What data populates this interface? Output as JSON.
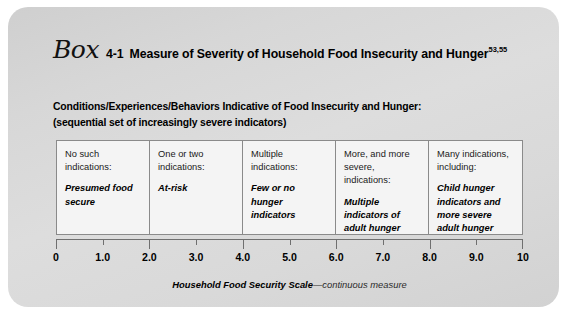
{
  "box": {
    "label_word": "Box",
    "number": "4-1",
    "title": "Measure of Severity of Household Food Insecurity and Hunger",
    "title_superscript": "53,55",
    "subtitle_line1": "Conditions/Experiences/Behaviors Indicative of Food Insecurity and Hunger:",
    "subtitle_line2": "(sequential set of increasingly severe indicators)"
  },
  "matrix": {
    "columns": [
      {
        "heading": "No such indications:",
        "emphasis": "Presumed food secure"
      },
      {
        "heading": "One or two indications:",
        "emphasis": "At-risk"
      },
      {
        "heading": "Multiple indications:",
        "emphasis": "Few or no hunger indicators"
      },
      {
        "heading": "More, and more severe, indications:",
        "emphasis": "Multiple indicators of adult hunger"
      },
      {
        "heading": "Many indications, including:",
        "emphasis": "Child hunger indicators and more severe adult hunger indicators"
      }
    ]
  },
  "chart_data": {
    "type": "table",
    "title": "Measure of Severity of Household Food Insecurity and Hunger",
    "xlabel": "Household Food Security Scale—continuous measure",
    "ylabel": "",
    "xlim": [
      0,
      10
    ],
    "grid": false,
    "legend": "none",
    "x_ticks": [
      {
        "value": 0,
        "label": "0",
        "major": true
      },
      {
        "value": 1,
        "label": "1.0",
        "major": false
      },
      {
        "value": 2,
        "label": "2.0",
        "major": true
      },
      {
        "value": 3,
        "label": "3.0",
        "major": false
      },
      {
        "value": 4,
        "label": "4.0",
        "major": true
      },
      {
        "value": 5,
        "label": "5.0",
        "major": false
      },
      {
        "value": 6,
        "label": "6.0",
        "major": true
      },
      {
        "value": 7,
        "label": "7.0",
        "major": false
      },
      {
        "value": 8,
        "label": "8.0",
        "major": true
      },
      {
        "value": 9,
        "label": "9.0",
        "major": false
      },
      {
        "value": 10,
        "label": "10",
        "major": true
      }
    ],
    "categories": [
      "No such indications: Presumed food secure",
      "One or two indications: At-risk",
      "Multiple indications: Few or no hunger indicators",
      "More, and more severe, indications: Multiple indicators of adult hunger",
      "Many indications, including: Child hunger indicators and more severe adult hunger indicators"
    ],
    "ranges": [
      [
        0,
        2
      ],
      [
        2,
        4
      ],
      [
        4,
        6
      ],
      [
        6,
        8
      ],
      [
        8,
        10
      ]
    ],
    "annotations": [
      "sequential set of increasingly severe indicators"
    ]
  },
  "caption": {
    "strong": "Household Food Security Scale",
    "rest": "—continuous measure"
  },
  "colors": {
    "panel_light": "#dddddd",
    "panel_dark": "#cfcfcf",
    "cell_background": "#f4f4f4",
    "rule": "#8a8a8a",
    "axis": "#6f6f6f",
    "text": "#000000"
  }
}
